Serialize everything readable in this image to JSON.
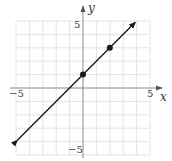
{
  "chart_data": {
    "type": "line",
    "title": "",
    "xlabel": "x",
    "ylabel": "y",
    "xlim": [
      -5,
      5
    ],
    "ylim": [
      -5,
      5
    ],
    "grid": true,
    "tick_labels": {
      "x": [
        {
          "value": -5,
          "label": "−5"
        },
        {
          "value": 5,
          "label": "5"
        }
      ],
      "y": [
        {
          "value": 5,
          "label": "5"
        },
        {
          "value": -5,
          "label": "−5"
        }
      ]
    },
    "series": [
      {
        "name": "line",
        "equation": "y = x + 1",
        "x": [
          -4.9,
          3.9
        ],
        "y": [
          -3.9,
          4.9
        ],
        "arrows": "both"
      }
    ],
    "points": [
      {
        "x": 0,
        "y": 1
      },
      {
        "x": 2,
        "y": 3
      }
    ],
    "colors": {
      "line": "#1a1a1a",
      "axis": "#888888",
      "grid": "#e4e4e4"
    }
  },
  "labels": {
    "x_axis": "x",
    "y_axis": "y",
    "x_min": "−5",
    "x_max": "5",
    "y_max": "5",
    "y_min": "−5"
  }
}
